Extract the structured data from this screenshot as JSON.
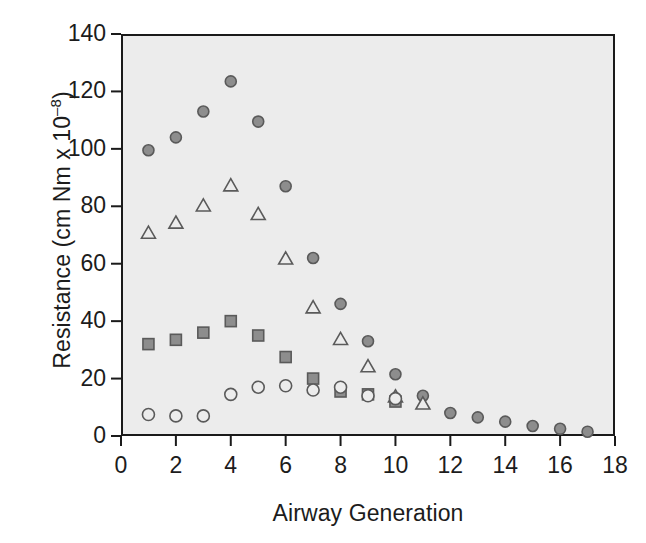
{
  "chart_data": {
    "type": "scatter",
    "title": "",
    "xlabel": "Airway Generation",
    "ylabel": "Resistance (cm Nm x 10",
    "ylabel_sup": "–8",
    "ylabel_close": ")",
    "xlim": [
      0,
      18
    ],
    "ylim": [
      0,
      140
    ],
    "xticks": [
      0,
      2,
      4,
      6,
      8,
      10,
      12,
      14,
      16,
      18
    ],
    "yticks": [
      0,
      20,
      40,
      60,
      80,
      100,
      120,
      140
    ],
    "xtick_labels": [
      "0",
      "2",
      "4",
      "6",
      "8",
      "10",
      "12",
      "14",
      "16",
      "18"
    ],
    "ytick_labels": [
      "0",
      "20",
      "40",
      "60",
      "80",
      "100",
      "120",
      "140"
    ],
    "grid": false,
    "legend": "none",
    "plot_background": "#ececec",
    "marker_fill": "#8d8d8d",
    "marker_edge": "#5a5a5a",
    "open_marker_fill": "#ececec",
    "axis_color": "#1a1a1a",
    "series": [
      {
        "name": "filled-circle-series",
        "marker": "circle-filled",
        "x": [
          1,
          2,
          3,
          4,
          5,
          6,
          7,
          8,
          9,
          10,
          11,
          12,
          13,
          14,
          15,
          16,
          17
        ],
        "y": [
          99.5,
          104,
          113,
          123.5,
          109.5,
          87,
          62,
          46,
          33,
          21.5,
          14,
          8,
          6.5,
          5,
          3.5,
          2.5,
          1.5
        ]
      },
      {
        "name": "triangle-series",
        "marker": "triangle-open",
        "x": [
          1,
          2,
          3,
          4,
          5,
          6,
          7,
          8,
          9,
          10,
          11
        ],
        "y": [
          70.5,
          74,
          80,
          87,
          77,
          61.5,
          44.5,
          33.5,
          24,
          13.5,
          11
        ]
      },
      {
        "name": "square-series",
        "marker": "square-filled",
        "x": [
          1,
          2,
          3,
          4,
          5,
          6,
          7,
          8,
          9,
          10
        ],
        "y": [
          32,
          33.5,
          36,
          40,
          35,
          27.5,
          20,
          15.5,
          14.5,
          12
        ]
      },
      {
        "name": "open-circle-series",
        "marker": "circle-open",
        "x": [
          1,
          2,
          3,
          4,
          5,
          6,
          7,
          8,
          9,
          10
        ],
        "y": [
          7.5,
          7,
          7,
          14.5,
          17,
          17.5,
          16,
          17,
          14,
          13
        ]
      }
    ]
  }
}
